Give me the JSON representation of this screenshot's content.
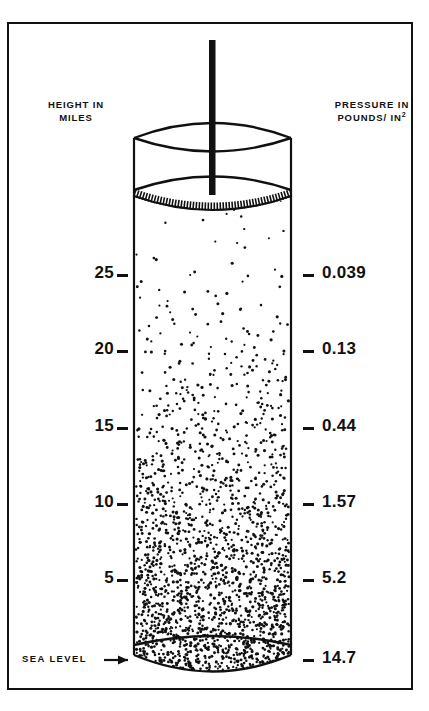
{
  "figure": {
    "title_left": "HEIGHT IN\nMILES",
    "title_right_line1": "PRESSURE IN",
    "title_right_line2": "POUNDS/ IN",
    "title_right_exponent": "2",
    "sea_level_label": "SEA LEVEL"
  },
  "chart_data": {
    "type": "scatter",
    "xlabel": "",
    "ylabel": "HEIGHT IN MILES",
    "y2label": "PRESSURE IN POUNDS/IN2",
    "grid": false,
    "legend": "none",
    "ylim": [
      0,
      28
    ],
    "categories": [
      "25",
      "20",
      "15",
      "10",
      "5",
      "SEA LEVEL"
    ],
    "series": [
      {
        "name": "Height (miles)",
        "values": [
          25,
          20,
          15,
          10,
          5,
          0
        ]
      },
      {
        "name": "Pressure (pounds per square inch)",
        "values": [
          0.039,
          0.13,
          0.44,
          1.57,
          5.2,
          14.7
        ]
      }
    ],
    "points": [
      {
        "height_label": "25",
        "pressure_label": "0.039",
        "y_px": 275
      },
      {
        "height_label": "20",
        "pressure_label": "0.13",
        "y_px": 351
      },
      {
        "height_label": "15",
        "pressure_label": "0.44",
        "y_px": 428
      },
      {
        "height_label": "10",
        "pressure_label": "1.57",
        "y_px": 504
      },
      {
        "height_label": "5",
        "pressure_label": "5.2",
        "y_px": 580
      },
      {
        "height_label": "SEA LEVEL",
        "pressure_label": "14.7",
        "y_px": 660
      }
    ],
    "annotations": [
      "SEA LEVEL"
    ]
  },
  "colors": {
    "ink": "#111111",
    "background": "#ffffff"
  }
}
